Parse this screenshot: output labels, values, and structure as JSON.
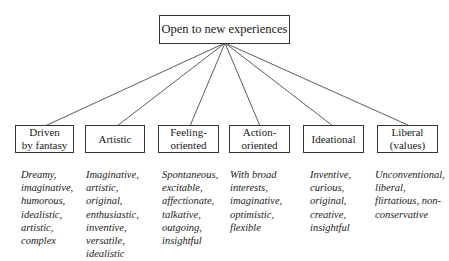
{
  "root": {
    "label": "Open to new experiences"
  },
  "facets": [
    {
      "label": "Driven\nby fantasy",
      "descriptors": "Dreamy,\nimaginative,\nhumorous,\nidealistic,\nartistic,\ncomplex"
    },
    {
      "label": "Artistic",
      "descriptors": "Imaginative,\nartistic,\noriginal,\nenthusiastic,\ninventive,\nversatile,\nidealistic"
    },
    {
      "label": "Feeling-\noriented",
      "descriptors": "Spontaneous,\nexcitable,\naffectionate,\ntalkative,\noutgoing,\ninsightful"
    },
    {
      "label": "Action-\noriented",
      "descriptors": "With broad\ninterests,\nimaginative,\noptimistic,\nflexible"
    },
    {
      "label": "Ideational",
      "descriptors": "Inventive,\ncurious,\noriginal,\ncreative,\ninsightful"
    },
    {
      "label": "Liberal\n(values)",
      "descriptors": "Unconventional,\nliberal,\nflirtatious, non-\nconservative"
    }
  ]
}
